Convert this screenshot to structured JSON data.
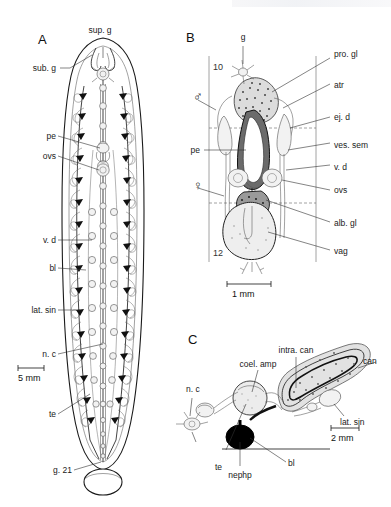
{
  "figure": {
    "domain_kind": "scientific-anatomical-plate",
    "background_color": "#ffffff",
    "ink_color": "#1a1a1a",
    "width": 391,
    "height": 507
  },
  "panels": [
    {
      "letter": "A",
      "caption_labels": [
        {
          "key": "sup_g",
          "text": "sup. g"
        },
        {
          "key": "sub_g",
          "text": "sub. g"
        },
        {
          "key": "pe",
          "text": "pe"
        },
        {
          "key": "ovs",
          "text": "ovs"
        },
        {
          "key": "v_d",
          "text": "v. d"
        },
        {
          "key": "bl",
          "text": "bl"
        },
        {
          "key": "lat_sin",
          "text": "lat. sin"
        },
        {
          "key": "n_c",
          "text": "n. c"
        },
        {
          "key": "te",
          "text": "te"
        },
        {
          "key": "g_21",
          "text": "g. 21"
        }
      ],
      "scale_bar": {
        "text": "5 mm",
        "length_px": 26
      }
    },
    {
      "letter": "B",
      "caption_labels": [
        {
          "key": "g",
          "text": "g"
        },
        {
          "key": "pro_gl",
          "text": "pro. gl"
        },
        {
          "key": "atr",
          "text": "atr"
        },
        {
          "key": "ej_d",
          "text": "ej. d"
        },
        {
          "key": "ves_sem",
          "text": "ves. sem"
        },
        {
          "key": "v_d",
          "text": "v. d"
        },
        {
          "key": "ovs",
          "text": "ovs"
        },
        {
          "key": "alb_gl",
          "text": "alb. gl"
        },
        {
          "key": "vag",
          "text": "vag"
        },
        {
          "key": "pe",
          "text": "pe"
        }
      ],
      "segment_numbers": [
        "10",
        "12"
      ],
      "sex_symbols": [
        {
          "key": "male",
          "glyph": "♂"
        },
        {
          "key": "female",
          "glyph": "♀"
        }
      ],
      "scale_bar": {
        "text": "1 mm",
        "length_px": 44
      }
    },
    {
      "letter": "C",
      "caption_labels": [
        {
          "key": "intra_can",
          "text": "intra. can"
        },
        {
          "key": "can",
          "text": "can"
        },
        {
          "key": "coel_amp",
          "text": "coel. amp"
        },
        {
          "key": "lat_sin",
          "text": "lat. sin"
        },
        {
          "key": "n_c",
          "text": "n. c"
        },
        {
          "key": "te",
          "text": "te"
        },
        {
          "key": "nephp",
          "text": "nephp"
        },
        {
          "key": "bl",
          "text": "bl"
        }
      ],
      "scale_bar": {
        "text": "2 mm",
        "length_px": 28
      }
    }
  ],
  "colors": {
    "ink": "#1a1a1a",
    "light_stroke": "#6b6b6b",
    "organ_fill": "#f2f2f2",
    "solid_black": "#000000",
    "paper": "#ffffff"
  }
}
